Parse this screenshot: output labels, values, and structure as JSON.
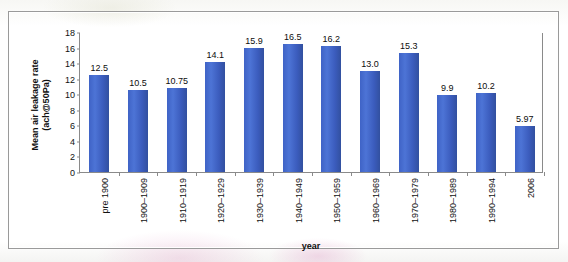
{
  "chart_data": {
    "type": "bar",
    "title": "",
    "xlabel": "year",
    "ylabel": "Mean air leakage rate (ach@50Pa)",
    "ylabel_line1": "Mean air leakage rate",
    "ylabel_line2": "(ach@50Pa)",
    "ylim": [
      0,
      18
    ],
    "ytick_step": 2,
    "yticks": [
      "18",
      "16",
      "14",
      "12",
      "10",
      "8",
      "6",
      "4",
      "2",
      "0"
    ],
    "grid": false,
    "legend": "none",
    "bar_color": "#3f63c6",
    "categories": [
      "pre 1900",
      "1900–1909",
      "1910–1919",
      "1920–1929",
      "1930–1939",
      "1940–1949",
      "1950–1959",
      "1960–1969",
      "1970–1979",
      "1980–1989",
      "1990–1994",
      "2006"
    ],
    "values": [
      12.5,
      10.5,
      10.75,
      14.1,
      15.9,
      16.5,
      16.2,
      13.0,
      15.3,
      9.9,
      10.2,
      5.97
    ],
    "value_labels": [
      "12.5",
      "10.5",
      "10.75",
      "14.1",
      "15.9",
      "16.5",
      "16.2",
      "13.0",
      "15.3",
      "9.9",
      "10.2",
      "5.97"
    ]
  }
}
